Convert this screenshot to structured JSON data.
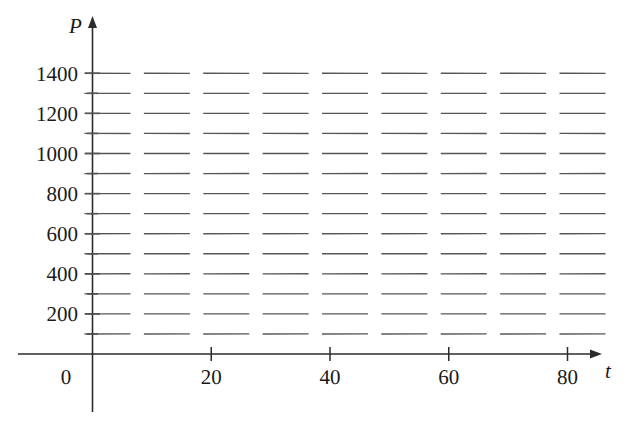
{
  "chart_data": {
    "type": "scatter",
    "title": "",
    "subtitle": "",
    "xlabel": "t",
    "ylabel": "P",
    "xlim": [
      -2,
      86
    ],
    "ylim": [
      -60,
      1520
    ],
    "grid": false,
    "legend": null,
    "equilibrium": 1000,
    "carrying_capacity": 1000,
    "growth_rate": 0.0001,
    "x_ticks": [
      0,
      20,
      40,
      60,
      80
    ],
    "x_tick_labels": [
      "0",
      "20",
      "40",
      "60",
      "80"
    ],
    "y_ticks": [
      200,
      400,
      600,
      800,
      1000,
      1200,
      1400
    ],
    "y_tick_labels": [
      "200",
      "400",
      "600",
      "800",
      "1000",
      "1200",
      "1400"
    ],
    "y_minor_ticks": [
      100,
      300,
      500,
      700,
      900,
      1100,
      1300
    ],
    "slope_field": {
      "t_values": [
        0,
        10,
        20,
        30,
        40,
        50,
        60,
        70,
        80
      ],
      "p_values": [
        100,
        200,
        300,
        400,
        500,
        600,
        700,
        800,
        900,
        1000,
        1100,
        1200,
        1300,
        1400
      ],
      "slopes_by_p": [
        {
          "P": 100,
          "slope": 0.009
        },
        {
          "P": 200,
          "slope": 0.016
        },
        {
          "P": 300,
          "slope": 0.021
        },
        {
          "P": 400,
          "slope": 0.024
        },
        {
          "P": 500,
          "slope": 0.025
        },
        {
          "P": 600,
          "slope": 0.024
        },
        {
          "P": 700,
          "slope": 0.021
        },
        {
          "P": 800,
          "slope": 0.016
        },
        {
          "P": 900,
          "slope": 0.009
        },
        {
          "P": 1000,
          "slope": 0
        },
        {
          "P": 1100,
          "slope": -0.011
        },
        {
          "P": 1200,
          "slope": -0.024
        },
        {
          "P": 1300,
          "slope": -0.039
        },
        {
          "P": 1400,
          "slope": -0.056
        }
      ]
    },
    "colors": {
      "axis": "#2b2b2b",
      "slope_mark": "#55565a",
      "background": "#ffffff",
      "text": "#1a1a1a"
    }
  },
  "axes": {
    "vertical_label": "P",
    "horizontal_label": "t",
    "origin_label": "0",
    "y_labels": [
      "1400",
      "1200",
      "1000",
      "800",
      "600",
      "400",
      "200"
    ],
    "x_labels": [
      "20",
      "40",
      "60",
      "80"
    ]
  }
}
